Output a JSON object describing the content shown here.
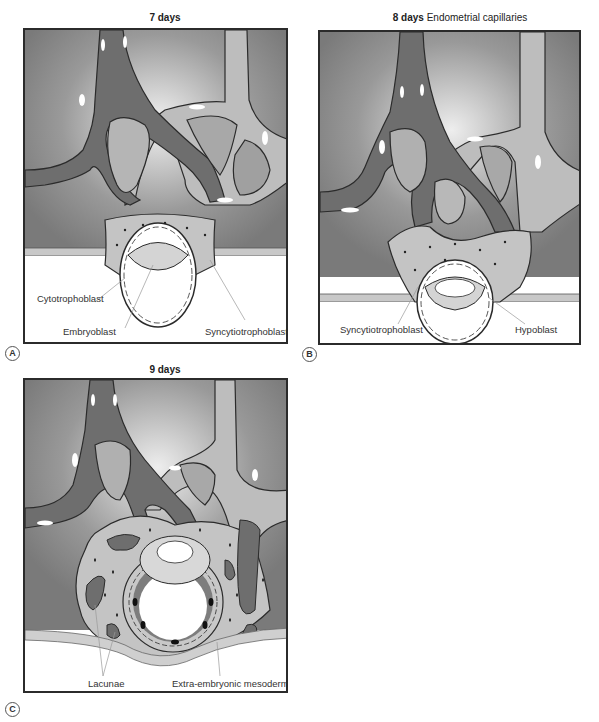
{
  "panels": [
    {
      "id": "A",
      "letter": "A",
      "title_bold": "7 days",
      "title_rest": "",
      "labels": [
        "Cytotrophoblast",
        "Embryoblast",
        "Syncytiotrophoblast"
      ]
    },
    {
      "id": "B",
      "letter": "B",
      "title_bold": "8 days",
      "title_rest": "Endometrial capillaries",
      "labels": [
        "Syncytiotrophoblast",
        "Hypoblast"
      ]
    },
    {
      "id": "C",
      "letter": "C",
      "title_bold": "9 days",
      "title_rest": "",
      "labels": [
        "Lacunae",
        "Extra-embryonic mesoderm"
      ]
    }
  ],
  "colors": {
    "endometrium": "#7d7d7d",
    "capillary_dark": "#6e6e6e",
    "capillary_light": "#bdbdbd",
    "trophoblast": "#c4c4c4",
    "outline": "#2b2b2b",
    "cavity": "#ffffff"
  }
}
